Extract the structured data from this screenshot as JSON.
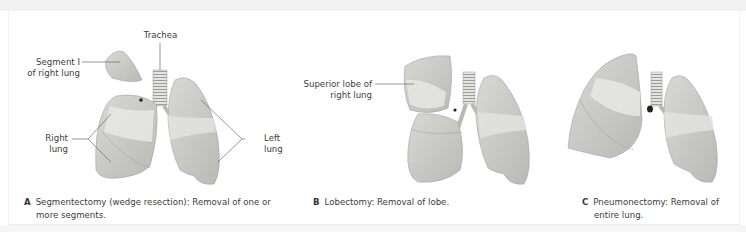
{
  "panels": [
    {
      "letter": "A",
      "caption_line1": "Segmentectomy (wedge resection): Removal of one or",
      "caption_line2": "more segments.",
      "labels": {
        "trachea": "Trachea",
        "segment_line1": "Segment I",
        "segment_line2": "of right lung",
        "right_line1": "Right",
        "right_line2": "lung",
        "left_line1": "Left",
        "left_line2": "lung"
      }
    },
    {
      "letter": "B",
      "caption_line1": "Lobectomy: Removal of lobe.",
      "labels": {
        "superior_line1": "Superior lobe of",
        "superior_line2": "right lung"
      }
    },
    {
      "letter": "C",
      "caption_line1": "Pneumonectomy: Removal of",
      "caption_line2": "entire lung."
    }
  ],
  "colors": {
    "lung_fill": "#c9cac6",
    "lung_light": "#e6e6e3",
    "lung_dark": "#a9aaa5",
    "leader_line": "#555555"
  }
}
